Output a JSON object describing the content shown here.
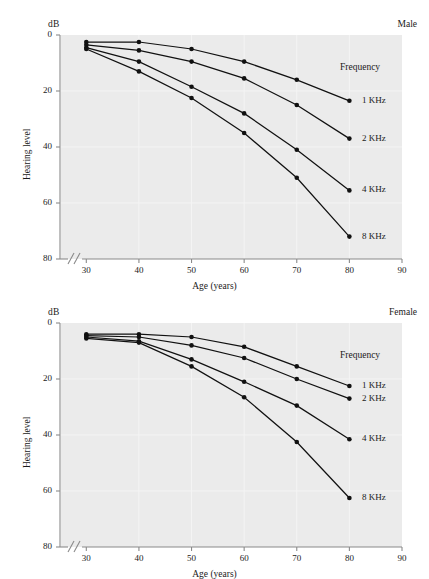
{
  "figure": {
    "unit_label": "dB",
    "ylabel": "Hearing level",
    "xlabel": "Age (years)",
    "legend_title": "Frequency",
    "panels": [
      "Male",
      "Female"
    ]
  },
  "axes": {
    "x_ticks": [
      "30",
      "40",
      "50",
      "60",
      "70",
      "80",
      "90"
    ],
    "y_ticks": [
      "0",
      "20",
      "40",
      "60",
      "80"
    ],
    "x_break_marker": "//"
  },
  "style": {
    "plot_background": "#ebebeb",
    "line_color": "#111111",
    "marker_color": "#111111",
    "axis_color": "#8a8a8a",
    "text_color": "#1a1a1a"
  },
  "chart_data": [
    {
      "type": "line",
      "title": "Male",
      "xlabel": "Age (years)",
      "ylabel": "Hearing level",
      "yunit": "dB",
      "x": [
        30,
        40,
        50,
        60,
        70,
        80
      ],
      "xlim": [
        25,
        90
      ],
      "ylim": [
        0,
        80
      ],
      "y_inverted": true,
      "grid": false,
      "legend_position": "right",
      "legend_title": "Frequency",
      "series": [
        {
          "name": "1 KHz",
          "values": [
            2.5,
            2.5,
            5.0,
            9.5,
            16.0,
            23.5
          ]
        },
        {
          "name": "2 KHz",
          "values": [
            3.5,
            5.5,
            9.5,
            15.5,
            25.0,
            37.0
          ]
        },
        {
          "name": "4 KHz",
          "values": [
            4.5,
            9.5,
            18.5,
            28.0,
            41.0,
            55.5
          ]
        },
        {
          "name": "8 KHz",
          "values": [
            5.0,
            13.0,
            22.5,
            35.0,
            51.0,
            72.0
          ]
        }
      ]
    },
    {
      "type": "line",
      "title": "Female",
      "xlabel": "Age (years)",
      "ylabel": "Hearing level",
      "yunit": "dB",
      "x": [
        30,
        40,
        50,
        60,
        70,
        80
      ],
      "xlim": [
        25,
        90
      ],
      "ylim": [
        0,
        80
      ],
      "y_inverted": true,
      "grid": false,
      "legend_position": "right",
      "legend_title": "Frequency",
      "series": [
        {
          "name": "1 KHz",
          "values": [
            4.0,
            4.0,
            5.0,
            8.5,
            15.5,
            22.5
          ]
        },
        {
          "name": "2 KHz",
          "values": [
            4.5,
            5.0,
            8.0,
            12.5,
            20.0,
            27.0
          ]
        },
        {
          "name": "4 KHz",
          "values": [
            5.0,
            6.5,
            13.0,
            21.0,
            29.5,
            41.5
          ]
        },
        {
          "name": "8 KHz",
          "values": [
            5.5,
            7.0,
            15.5,
            26.5,
            42.5,
            62.5
          ]
        }
      ]
    }
  ]
}
